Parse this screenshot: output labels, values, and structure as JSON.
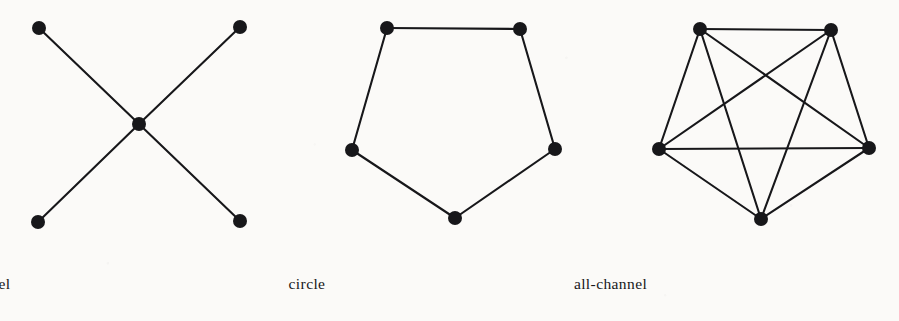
{
  "figure": {
    "background_color": "#fbfaf8",
    "ink_color": "#17171a",
    "node_radius": 7,
    "edge_width": 2.1,
    "panels": [
      {
        "id": "wheel",
        "caption": "wheel",
        "caption_center_x": 141,
        "description": "star network: four peripheral nodes each joined to one central node",
        "node_count": 5,
        "edge_count": 4,
        "nodes": [
          {
            "id": "n1",
            "label": "top-left",
            "x": 39,
            "y": 28
          },
          {
            "id": "n2",
            "label": "top-right",
            "x": 240,
            "y": 27
          },
          {
            "id": "n3",
            "label": "center",
            "x": 139,
            "y": 124
          },
          {
            "id": "n4",
            "label": "bottom-left",
            "x": 38,
            "y": 222
          },
          {
            "id": "n5",
            "label": "bottom-right",
            "x": 240,
            "y": 221
          }
        ],
        "edges": [
          [
            "n1",
            "n3"
          ],
          [
            "n2",
            "n3"
          ],
          [
            "n3",
            "n4"
          ],
          [
            "n3",
            "n5"
          ]
        ]
      },
      {
        "id": "circle",
        "caption": "circle",
        "caption_center_x": 457,
        "description": "pentagon ring: five nodes each joined to two neighbours",
        "node_count": 5,
        "edge_count": 5,
        "nodes": [
          {
            "id": "c1",
            "label": "top-left",
            "x": 387,
            "y": 28
          },
          {
            "id": "c2",
            "label": "top-right",
            "x": 520,
            "y": 29
          },
          {
            "id": "c3",
            "label": "right",
            "x": 555,
            "y": 149
          },
          {
            "id": "c4",
            "label": "bottom",
            "x": 455,
            "y": 218
          },
          {
            "id": "c5",
            "label": "left",
            "x": 352,
            "y": 150
          }
        ],
        "edges": [
          [
            "c1",
            "c2"
          ],
          [
            "c2",
            "c3"
          ],
          [
            "c3",
            "c4"
          ],
          [
            "c4",
            "c5"
          ],
          [
            "c5",
            "c1"
          ]
        ]
      },
      {
        "id": "all-channel",
        "caption": "all-channel",
        "caption_center_x": 761,
        "description": "complete graph on five nodes: every node joined to every other node",
        "node_count": 5,
        "edge_count": 10,
        "nodes": [
          {
            "id": "a1",
            "label": "top-left",
            "x": 700,
            "y": 29
          },
          {
            "id": "a2",
            "label": "top-right",
            "x": 831,
            "y": 30
          },
          {
            "id": "a3",
            "label": "right",
            "x": 869,
            "y": 148
          },
          {
            "id": "a4",
            "label": "bottom",
            "x": 761,
            "y": 219
          },
          {
            "id": "a5",
            "label": "left",
            "x": 659,
            "y": 149
          }
        ],
        "edges": [
          [
            "a1",
            "a2"
          ],
          [
            "a1",
            "a3"
          ],
          [
            "a1",
            "a4"
          ],
          [
            "a1",
            "a5"
          ],
          [
            "a2",
            "a3"
          ],
          [
            "a2",
            "a4"
          ],
          [
            "a2",
            "a5"
          ],
          [
            "a3",
            "a4"
          ],
          [
            "a3",
            "a5"
          ],
          [
            "a4",
            "a5"
          ]
        ]
      }
    ]
  }
}
